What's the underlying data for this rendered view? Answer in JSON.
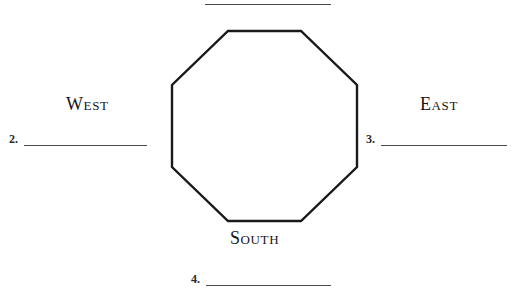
{
  "page": {
    "background_color": "#ffffff",
    "ink_color": "#1a1a1a"
  },
  "shape": {
    "name": "octagon",
    "sides": 8,
    "stroke_color": "#1a1a1a",
    "stroke_width": 2,
    "fill": "none"
  },
  "direction_labels": {
    "west": "West",
    "east": "East",
    "south": "South"
  },
  "answer_lines": [
    {
      "number": "1.",
      "label_visible": false,
      "cropped": true
    },
    {
      "number": "2.",
      "value": "",
      "position": "left"
    },
    {
      "number": "3.",
      "value": "",
      "position": "right"
    },
    {
      "number": "4.",
      "value": "",
      "position": "bottom"
    }
  ],
  "answers": {
    "two": "2.",
    "three": "3.",
    "four": "4."
  },
  "line_color": "#4a4a4a"
}
